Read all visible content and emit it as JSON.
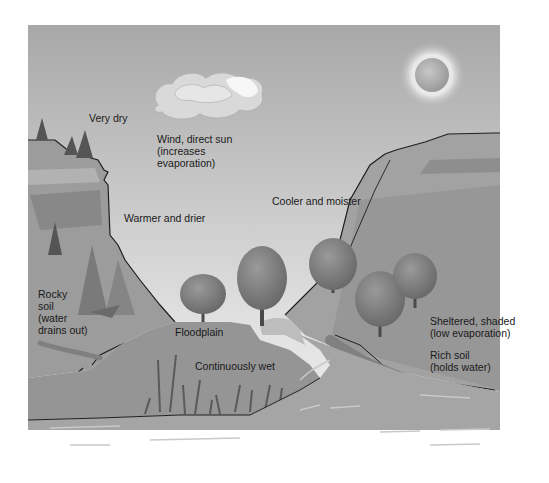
{
  "diagram": {
    "labels": {
      "very_dry": "Very dry",
      "wind_sun": "Wind, direct sun\n(increases\nevaporation)",
      "warmer_drier": "Warmer and drier",
      "cooler_moister": "Cooler and moister",
      "rocky_soil": "Rocky\nsoil\n(water\ndrains out)",
      "floodplain": "Floodplain",
      "continuously_wet": "Continuously wet",
      "sheltered": "Sheltered, shaded\n(low evaporation)",
      "rich_soil": "Rich soil\n(holds water)"
    },
    "colors": {
      "sky_top": "#a9a9a9",
      "sky_bottom": "#e6e6e6",
      "hill": "#9a9a9a",
      "hill_dark": "#8a8a8a",
      "water": "#a3a3a3",
      "water_highlight": "#c8c8c8",
      "outline": "#1f1f1f",
      "tree": "#7d7d7d"
    }
  }
}
